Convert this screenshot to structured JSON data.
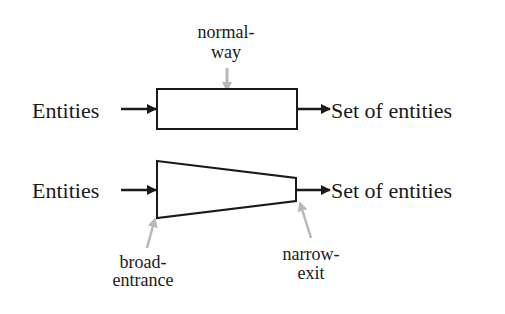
{
  "diagram": {
    "top_process": {
      "input_label": "Entities",
      "output_label": "Set of entities",
      "annotation_line1": "normal-",
      "annotation_line2": "way",
      "shape": "rectangle"
    },
    "bottom_process": {
      "input_label": "Entities",
      "output_label": "Set of entities",
      "entrance_annotation_line1": "broad-",
      "entrance_annotation_line2": "entrance",
      "exit_annotation_line1": "narrow-",
      "exit_annotation_line2": "exit",
      "shape": "funnel-trapezoid"
    },
    "colors": {
      "stroke": "#1a1a1a",
      "annotation_arrow": "#b8b8b8",
      "background": "#ffffff"
    }
  }
}
